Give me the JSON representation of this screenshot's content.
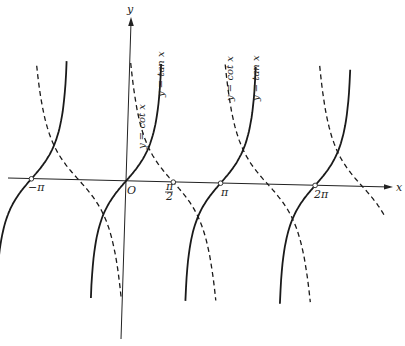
{
  "chart_data": {
    "type": "line",
    "title": "",
    "xlabel": "x",
    "ylabel": "y",
    "origin_label": "O",
    "x_tick_labels": [
      "−π",
      "π/2",
      "π",
      "2π"
    ],
    "x_tick_values": [
      -3.1416,
      1.5708,
      3.1416,
      6.2832
    ],
    "xlim": [
      -4.0,
      8.6
    ],
    "ylim": [
      -4.0,
      4.5
    ],
    "grid": false,
    "legend": "inline rotated labels",
    "series": [
      {
        "name": "y = tan x",
        "style": "solid",
        "function": "tan(x)",
        "branches": [
          [
            -4.3,
            -1.85
          ],
          [
            -1.29,
            1.29
          ],
          [
            1.85,
            4.43
          ],
          [
            4.99,
            7.57
          ]
        ],
        "zeros": [
          -3.1416,
          0,
          3.1416,
          6.2832
        ]
      },
      {
        "name": "y = cot x",
        "style": "dashed",
        "function": "cot(x)",
        "branches": [
          [
            -2.85,
            -0.28
          ],
          [
            0.28,
            2.86
          ],
          [
            3.42,
            6.0
          ],
          [
            6.56,
            8.55
          ]
        ],
        "zeros": [
          -1.5708,
          1.5708,
          4.7124,
          7.854
        ]
      }
    ],
    "annotations": [
      {
        "text": "y = cot x",
        "near": "first cot branch right of y-axis",
        "rotation": -90
      },
      {
        "text": "y = tan x",
        "near": "first tan branch right of y-axis",
        "rotation": -90
      },
      {
        "text": "y = cot x",
        "near": "second cot branch",
        "rotation": -90
      },
      {
        "text": "y = tan x",
        "near": "second tan branch",
        "rotation": -90
      }
    ],
    "marked_points": [
      {
        "label": "−π",
        "x": -3.1416,
        "y": 0
      },
      {
        "label": "π/2",
        "x": 1.5708,
        "y": 0
      },
      {
        "label": "π",
        "x": 3.1416,
        "y": 0
      },
      {
        "label": "2π",
        "x": 6.2832,
        "y": 0
      }
    ]
  },
  "labels": {
    "y_axis": "y",
    "x_axis": "x",
    "origin": "O",
    "neg_pi": "−π",
    "pi_num": "π",
    "pi_den": "2",
    "pi": "π",
    "two_pi": "2π",
    "cot1": "y = cot x",
    "tan1": "y = tan x",
    "cot2": "y = cot x",
    "tan2": "y = tan x"
  }
}
